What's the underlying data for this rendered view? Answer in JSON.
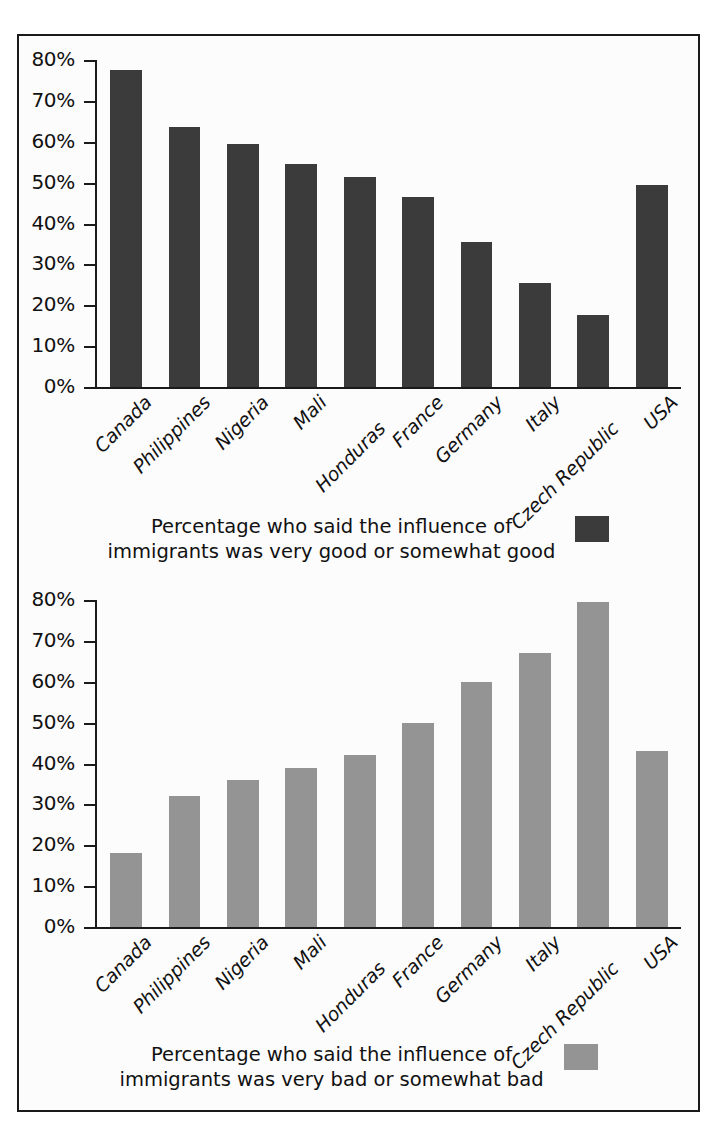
{
  "figure": {
    "border_color": "#1a1a1a",
    "background": "#fcfcfc"
  },
  "chart_data": [
    {
      "id": "good",
      "type": "bar",
      "title": "",
      "subtitle": "",
      "xlabel": "",
      "ylabel": "",
      "ylim": [
        0,
        80
      ],
      "grid": false,
      "legend_position": "bottom",
      "bar_color": "#3b3b3b",
      "categories": [
        "Canada",
        "Philippines",
        "Nigeria",
        "Mali",
        "Honduras",
        "France",
        "Germany",
        "Italy",
        "Czech Republic",
        "USA"
      ],
      "values": [
        77.5,
        63.5,
        59.5,
        54.5,
        51.5,
        46.5,
        35.5,
        25.5,
        17.5,
        49.5
      ],
      "ticks": [
        "0%",
        "10%",
        "20%",
        "30%",
        "40%",
        "50%",
        "60%",
        "70%",
        "80%"
      ],
      "tick_values": [
        0,
        10,
        20,
        30,
        40,
        50,
        60,
        70,
        80
      ],
      "legend": {
        "line1": "Percentage who said the influence of",
        "line2": "immigrants was very good or somewhat good",
        "swatch_color": "#3b3b3b"
      }
    },
    {
      "id": "bad",
      "type": "bar",
      "title": "",
      "subtitle": "",
      "xlabel": "",
      "ylabel": "",
      "ylim": [
        0,
        80
      ],
      "grid": false,
      "legend_position": "bottom",
      "bar_color": "#949494",
      "categories": [
        "Canada",
        "Philippines",
        "Nigeria",
        "Mali",
        "Honduras",
        "France",
        "Germany",
        "Italy",
        "Czech Republic",
        "USA"
      ],
      "values": [
        18.0,
        32.0,
        36.0,
        39.0,
        42.0,
        50.0,
        60.0,
        67.0,
        79.5,
        43.0
      ],
      "ticks": [
        "0%",
        "10%",
        "20%",
        "30%",
        "40%",
        "50%",
        "60%",
        "70%",
        "80%"
      ],
      "tick_values": [
        0,
        10,
        20,
        30,
        40,
        50,
        60,
        70,
        80
      ],
      "legend": {
        "line1": "Percentage who said the influence of",
        "line2": "immigrants was very bad or somewhat bad",
        "swatch_color": "#949494"
      }
    }
  ]
}
